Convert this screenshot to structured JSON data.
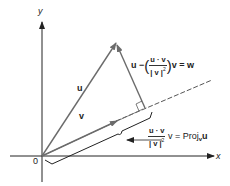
{
  "diagram": {
    "axes": {
      "x_label": "x",
      "y_label": "y",
      "origin_label": "0"
    },
    "vectors": [
      {
        "name": "u",
        "label": "u"
      },
      {
        "name": "v",
        "label": "v"
      }
    ],
    "formulas": {
      "w": {
        "prefix": "u",
        "minus": "−",
        "numerator": "u · v",
        "denominator": "| v |",
        "power": "2",
        "suffix": "v",
        "equals": "= w",
        "open_paren": "(",
        "close_paren": ")"
      },
      "proj": {
        "numerator": "u · v",
        "denominator": "| v |",
        "power": "2",
        "after": "v = Proj",
        "sub": "v",
        "tail": "u"
      }
    },
    "colors": {
      "vector_line": "#6b6b6b",
      "axis": "#222222",
      "text": "#222222",
      "background": "#ffffff"
    }
  }
}
